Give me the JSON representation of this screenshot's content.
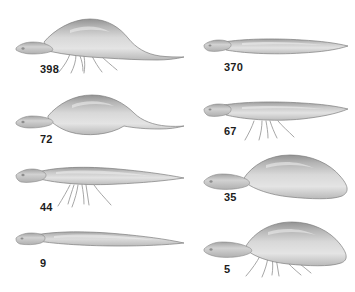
{
  "figure": {
    "background_color": "#ffffff",
    "label_color": "#1c1c1c",
    "body_fill_dark": "#9a9a9a",
    "body_fill_light": "#e2e2e2",
    "outline_color": "#7e7e7e",
    "appendage_color": "#9c9c9c",
    "columns": 2,
    "rows": 4
  },
  "specimens": [
    {
      "label": "398",
      "row": 1,
      "column": "left",
      "morphology": "deep-humped body with long tapering tail and ventral filaments",
      "has_appendages": true,
      "appendage_count": 5,
      "body_depth": "deep"
    },
    {
      "label": "370",
      "row": 1,
      "column": "right",
      "morphology": "slender elongate body, no ventral filaments",
      "has_appendages": false,
      "appendage_count": 0,
      "body_depth": "slender"
    },
    {
      "label": "72",
      "row": 2,
      "column": "left",
      "morphology": "fusiform spindle body with tapering tail, no ventral filaments",
      "has_appendages": false,
      "appendage_count": 0,
      "body_depth": "medium-deep"
    },
    {
      "label": "67",
      "row": 2,
      "column": "right",
      "morphology": "slender elongate body with ventral filaments",
      "has_appendages": true,
      "appendage_count": 5,
      "body_depth": "slender"
    },
    {
      "label": "44",
      "row": 3,
      "column": "left",
      "morphology": "slender elongate body with long tail and ventral filaments",
      "has_appendages": true,
      "appendage_count": 5,
      "body_depth": "slender"
    },
    {
      "label": "35",
      "row": 3,
      "column": "right",
      "morphology": "deep rounded humped body, blunt posterior, no ventral filaments",
      "has_appendages": false,
      "appendage_count": 0,
      "body_depth": "deep"
    },
    {
      "label": "9",
      "row": 4,
      "column": "left",
      "morphology": "very slender elongate body with long thin tail, no ventral filaments",
      "has_appendages": false,
      "appendage_count": 0,
      "body_depth": "very-slender"
    },
    {
      "label": "5",
      "row": 4,
      "column": "right",
      "morphology": "deep humped body with ventral filaments",
      "has_appendages": true,
      "appendage_count": 5,
      "body_depth": "deep"
    }
  ]
}
